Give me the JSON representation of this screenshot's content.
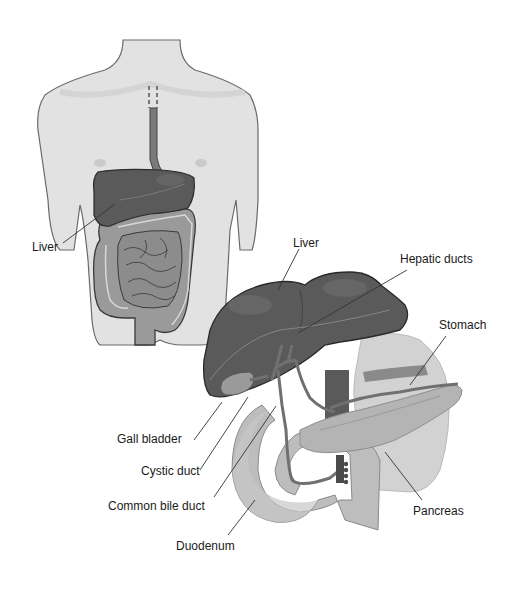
{
  "figure": {
    "torso_view": {
      "labels": [
        {
          "id": "liver_torso",
          "text": "Liver",
          "x": 32,
          "y": 240
        }
      ]
    },
    "detail_view": {
      "labels": [
        {
          "id": "liver_detail",
          "text": "Liver",
          "x": 293,
          "y": 236
        },
        {
          "id": "hepatic_ducts",
          "text": "Hepatic ducts",
          "x": 400,
          "y": 252
        },
        {
          "id": "stomach",
          "text": "Stomach",
          "x": 439,
          "y": 318
        },
        {
          "id": "gall_bladder",
          "text": "Gall bladder",
          "x": 117,
          "y": 432
        },
        {
          "id": "cystic_duct",
          "text": "Cystic duct",
          "x": 141,
          "y": 464
        },
        {
          "id": "common_bile_duct",
          "text": "Common bile duct",
          "x": 108,
          "y": 499
        },
        {
          "id": "pancreas",
          "text": "Pancreas",
          "x": 413,
          "y": 504
        },
        {
          "id": "duodenum",
          "text": "Duodenum",
          "x": 176,
          "y": 539
        }
      ]
    },
    "colors": {
      "body_skin": "#e2e2e2",
      "body_outline": "#6a6a6a",
      "liver": "#5a5a5a",
      "liver_dark": "#4a4a4a",
      "intestine": "#9a9a9a",
      "duct": "#707070",
      "pancreas": "#b4b4b4",
      "stomach": "#d2d2d2",
      "vessel": "#6e6e6e",
      "leader_line": "#333333",
      "text": "#1a1a1a"
    }
  }
}
